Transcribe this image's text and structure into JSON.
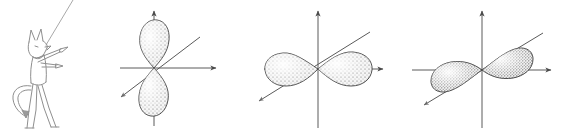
{
  "figure": {
    "background_color": "#ffffff",
    "ink_color": "#3a3a3a",
    "axis_color": "#555555",
    "lobe_fill_color": "#f2f2f2",
    "lobe_stipple_color": "#4a4a4a",
    "width": 562,
    "height": 133
  },
  "character": {
    "name": "cartoon-fox-pointer",
    "description": "line-art fox/wolf standing figure pointing to the right",
    "color": "#8a8a8a",
    "parts": [
      {
        "name": "head",
        "label": "head"
      },
      {
        "name": "ear-left",
        "label": "left ear"
      },
      {
        "name": "ear-right",
        "label": "right ear"
      },
      {
        "name": "snout",
        "label": "snout"
      },
      {
        "name": "torso",
        "label": "torso"
      },
      {
        "name": "pointing-arm",
        "label": "pointing arm"
      },
      {
        "name": "second-arm",
        "label": "second arm"
      },
      {
        "name": "leg-left",
        "label": "left leg"
      },
      {
        "name": "leg-right",
        "label": "right leg"
      },
      {
        "name": "tail",
        "label": "tail with arrow tip"
      }
    ],
    "pointer_line": {
      "name": "pointer-ray",
      "label": "diagonal ray from head to upper right"
    }
  },
  "orbitals": [
    {
      "id": "orbital-pz",
      "label": "p_z",
      "orientation": "vertical",
      "origin": {
        "x": 154,
        "y": 68
      },
      "lobes": [
        {
          "name": "upper-lobe",
          "direction": "up"
        },
        {
          "name": "lower-lobe",
          "direction": "down"
        }
      ],
      "axes": [
        {
          "name": "x-axis",
          "arrow": "right"
        },
        {
          "name": "z-axis",
          "arrow": "up"
        },
        {
          "name": "y-axis",
          "arrow": "down-left"
        }
      ]
    },
    {
      "id": "orbital-px",
      "label": "p_x",
      "orientation": "horizontal",
      "origin": {
        "x": 318,
        "y": 69
      },
      "lobes": [
        {
          "name": "left-lobe",
          "direction": "left"
        },
        {
          "name": "right-lobe",
          "direction": "right"
        }
      ],
      "axes": [
        {
          "name": "x-axis",
          "arrow": "right"
        },
        {
          "name": "z-axis",
          "arrow": "up"
        },
        {
          "name": "y-axis",
          "arrow": "down-left"
        }
      ]
    },
    {
      "id": "orbital-py",
      "label": "p_y",
      "orientation": "diagonal",
      "origin": {
        "x": 482,
        "y": 70
      },
      "lobes": [
        {
          "name": "upper-right-lobe",
          "direction": "up-right"
        },
        {
          "name": "lower-left-lobe",
          "direction": "down-left"
        }
      ],
      "axes": [
        {
          "name": "x-axis",
          "arrow": "right"
        },
        {
          "name": "z-axis",
          "arrow": "up"
        },
        {
          "name": "y-axis",
          "arrow": "down-left"
        }
      ]
    }
  ]
}
